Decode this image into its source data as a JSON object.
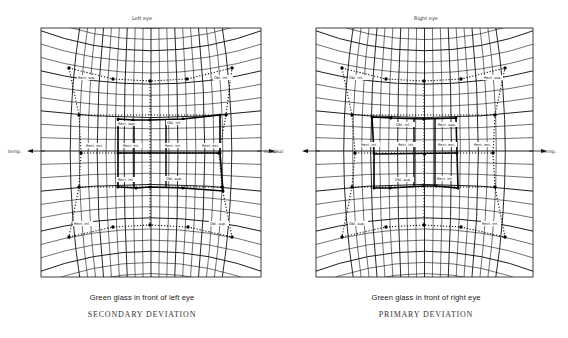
{
  "panels": [
    {
      "id": "left",
      "title": "Left eye",
      "frame": {
        "x": 41,
        "y": 28,
        "w": 220,
        "h": 249
      },
      "axis": {
        "left_label": "temp.",
        "right_label": "nasal",
        "y": 151
      },
      "caption_line1": "Green glass in front of left eye",
      "caption_line2": "SECONDARY DEVIATION",
      "outer_field": [
        [
          69,
          68
        ],
        [
          113,
          79
        ],
        [
          150,
          81
        ],
        [
          187,
          79
        ],
        [
          232,
          68
        ],
        [
          226,
          115
        ],
        [
          219,
          153
        ],
        [
          222,
          187
        ],
        [
          232,
          237
        ],
        [
          188,
          227
        ],
        [
          150,
          225
        ],
        [
          113,
          227
        ],
        [
          69,
          237
        ],
        [
          79,
          187
        ],
        [
          81,
          153
        ],
        [
          79,
          115
        ]
      ],
      "inner_field": [
        [
          118,
          119
        ],
        [
          133,
          120
        ],
        [
          150,
          120
        ],
        [
          183,
          119
        ],
        [
          220,
          115
        ],
        [
          220,
          153
        ],
        [
          223,
          191
        ],
        [
          183,
          188
        ],
        [
          150,
          187
        ],
        [
          136,
          188
        ],
        [
          118,
          187
        ],
        [
          118,
          153
        ]
      ],
      "inner_cross_h": [
        [
          118,
          153
        ],
        [
          220,
          153
        ]
      ],
      "inner_cross_v": [
        [
          134,
          120
        ],
        [
          134,
          188
        ]
      ],
      "inner_cross_v2": [
        [
          166,
          120
        ],
        [
          166,
          188
        ]
      ],
      "labels": [
        {
          "text": "Rect. sup.",
          "x": 78,
          "y": 79
        },
        {
          "text": "Obl. inf.",
          "x": 214,
          "y": 79
        },
        {
          "text": "Rect. sup.",
          "x": 118,
          "y": 125
        },
        {
          "text": "Obl. inf.",
          "x": 167,
          "y": 124
        },
        {
          "text": "Rect. ext.",
          "x": 86,
          "y": 147
        },
        {
          "text": "Rect. int.",
          "x": 123,
          "y": 147
        },
        {
          "text": "Rect. int.",
          "x": 165,
          "y": 147
        },
        {
          "text": "Rect. ext.",
          "x": 202,
          "y": 147
        },
        {
          "text": "Rect. inf.",
          "x": 118,
          "y": 181
        },
        {
          "text": "Obl. sup.",
          "x": 166,
          "y": 180
        },
        {
          "text": "Rect. inf.",
          "x": 74,
          "y": 225
        },
        {
          "text": "Obl. sup.",
          "x": 210,
          "y": 225
        }
      ]
    },
    {
      "id": "right",
      "title": "Right eye",
      "frame": {
        "x": 316,
        "y": 28,
        "w": 217,
        "h": 249
      },
      "axis": {
        "left_label": "nasal",
        "right_label": "temp.",
        "y": 151
      },
      "caption_line1": "Green glass in front of right eye",
      "caption_line2": "PRIMARY DEVIATION",
      "outer_field": [
        [
          342,
          68
        ],
        [
          386,
          79
        ],
        [
          424,
          81
        ],
        [
          461,
          79
        ],
        [
          505,
          68
        ],
        [
          495,
          115
        ],
        [
          493,
          153
        ],
        [
          495,
          187
        ],
        [
          505,
          237
        ],
        [
          461,
          227
        ],
        [
          424,
          225
        ],
        [
          386,
          227
        ],
        [
          342,
          237
        ],
        [
          352,
          187
        ],
        [
          355,
          153
        ],
        [
          352,
          115
        ]
      ],
      "inner_field": [
        [
          372,
          117
        ],
        [
          391,
          118
        ],
        [
          424,
          119
        ],
        [
          456,
          118
        ],
        [
          457,
          153
        ],
        [
          458,
          188
        ],
        [
          436,
          186
        ],
        [
          424,
          186
        ],
        [
          390,
          188
        ],
        [
          374,
          188
        ],
        [
          374,
          153
        ]
      ],
      "inner_cross_h": [
        [
          374,
          154
        ],
        [
          457,
          153
        ]
      ],
      "inner_cross_v": [
        [
          414,
          118
        ],
        [
          414,
          187
        ]
      ],
      "inner_cross_v2": [
        [
          435,
          118
        ],
        [
          435,
          186
        ]
      ],
      "labels": [
        {
          "text": "Obl. inf.",
          "x": 349,
          "y": 79
        },
        {
          "text": "Rect. sup.",
          "x": 484,
          "y": 79
        },
        {
          "text": "Obl. inf.",
          "x": 396,
          "y": 126
        },
        {
          "text": "Rect. sup.",
          "x": 438,
          "y": 126
        },
        {
          "text": "Rect. int.",
          "x": 361,
          "y": 146
        },
        {
          "text": "Rect. int.",
          "x": 398,
          "y": 146
        },
        {
          "text": "Rect. ext.",
          "x": 438,
          "y": 146
        },
        {
          "text": "Rect. ext.",
          "x": 474,
          "y": 146
        },
        {
          "text": "Obl. sup.",
          "x": 395,
          "y": 181
        },
        {
          "text": "Rect. inf.",
          "x": 437,
          "y": 180
        },
        {
          "text": "Obl. sup.",
          "x": 349,
          "y": 225
        },
        {
          "text": "Rect. inf.",
          "x": 482,
          "y": 225
        }
      ]
    }
  ]
}
